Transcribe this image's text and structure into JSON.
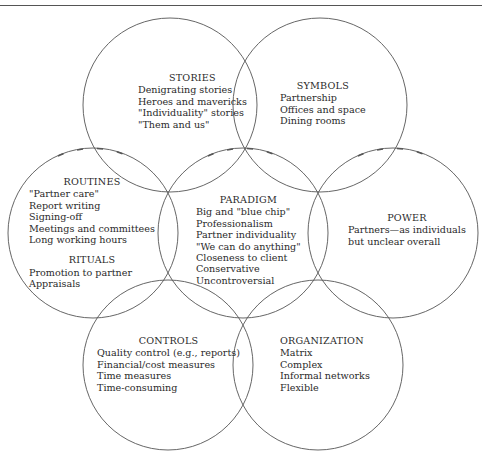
{
  "figure": {
    "title": "",
    "circles": [
      {
        "id": "stories",
        "heading": "STORIES",
        "items": [
          "Denigrating stories",
          "Heroes and mavericks",
          "\"Individuality\" stories",
          "\"Them and us\""
        ]
      },
      {
        "id": "symbols",
        "heading": "SYMBOLS",
        "items": [
          "Partnership",
          "Offices and space",
          "Dining rooms"
        ]
      },
      {
        "id": "routines",
        "heading": "ROUTINES",
        "items": [
          "\"Partner care\"",
          "Report writing",
          "Signing-off",
          "Meetings and committees",
          "Long working hours"
        ],
        "subheading": "RITUALS",
        "subitems": [
          "Promotion to partner",
          "Appraisals"
        ]
      },
      {
        "id": "paradigm",
        "heading": "PARADIGM",
        "items": [
          "Big and \"blue chip\"",
          "Professionalism",
          "Partner individuality",
          "\"We can do anything\"",
          "Closeness to client",
          "Conservative",
          "Uncontroversial"
        ]
      },
      {
        "id": "power",
        "heading": "POWER",
        "items": [
          "Partners—as individuals",
          "but unclear overall"
        ]
      },
      {
        "id": "controls",
        "heading": "CONTROLS",
        "items": [
          "Quality control (e.g., reports)",
          "Financial/cost measures",
          "Time measures",
          "Time-consuming"
        ]
      },
      {
        "id": "organization",
        "heading": "ORGANIZATION",
        "items": [
          "Matrix",
          "Complex",
          "Informal networks",
          "Flexible"
        ]
      }
    ]
  }
}
